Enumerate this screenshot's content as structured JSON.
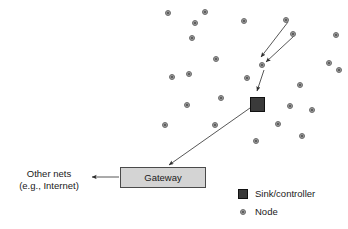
{
  "diagram": {
    "background_color": "#ffffff",
    "line_color": "#444444",
    "node_fill": "#9a9a9a",
    "node_stroke": "#6e6e6e",
    "sink_fill": "#3a3a3a",
    "gateway_fill": "#d4d4d4",
    "gateway_stroke": "#4a4a4a",
    "text_color": "#1a1a1a"
  },
  "labels": {
    "other_nets_line1": "Other nets",
    "other_nets_line2": "(e.g., Internet)",
    "gateway": "Gateway"
  },
  "legend": {
    "items": [
      {
        "label": "Sink/controller",
        "marker": "filled-square",
        "color": "#3a3a3a"
      },
      {
        "label": "Node",
        "marker": "small-circle",
        "color": "#9a9a9a"
      }
    ]
  },
  "nodes": [
    {
      "id": "n1",
      "x": 168,
      "y": 13
    },
    {
      "id": "n2",
      "x": 205,
      "y": 12
    },
    {
      "id": "n3",
      "x": 195,
      "y": 23
    },
    {
      "id": "n4",
      "x": 244,
      "y": 21
    },
    {
      "id": "n5",
      "x": 286,
      "y": 20
    },
    {
      "id": "n6",
      "x": 192,
      "y": 38
    },
    {
      "id": "n7",
      "x": 293,
      "y": 34
    },
    {
      "id": "n8",
      "x": 336,
      "y": 35
    },
    {
      "id": "n9",
      "x": 216,
      "y": 59
    },
    {
      "id": "n10",
      "x": 262,
      "y": 65
    },
    {
      "id": "n11",
      "x": 329,
      "y": 63
    },
    {
      "id": "n12",
      "x": 189,
      "y": 74
    },
    {
      "id": "n13",
      "x": 247,
      "y": 78
    },
    {
      "id": "n14",
      "x": 300,
      "y": 85
    },
    {
      "id": "n15",
      "x": 339,
      "y": 70
    },
    {
      "id": "n16",
      "x": 172,
      "y": 77
    },
    {
      "id": "n17",
      "x": 221,
      "y": 98
    },
    {
      "id": "n18",
      "x": 187,
      "y": 105
    },
    {
      "id": "n19",
      "x": 290,
      "y": 106
    },
    {
      "id": "n20",
      "x": 312,
      "y": 110
    },
    {
      "id": "n21",
      "x": 165,
      "y": 125
    },
    {
      "id": "n22",
      "x": 215,
      "y": 125
    },
    {
      "id": "n23",
      "x": 278,
      "y": 124
    },
    {
      "id": "n24",
      "x": 256,
      "y": 141
    },
    {
      "id": "n25",
      "x": 302,
      "y": 136
    }
  ],
  "sink": {
    "x": 250,
    "y": 97,
    "size": 15
  },
  "gateway_box": {
    "x": 120,
    "y": 167,
    "width": 86,
    "height": 21
  },
  "arrows": [
    {
      "name": "node-to-relay-1",
      "from": [
        288,
        22
      ],
      "to": [
        261,
        57
      ]
    },
    {
      "name": "node-to-relay-2",
      "from": [
        294,
        36
      ],
      "to": [
        266,
        62
      ]
    },
    {
      "name": "relay-to-sink",
      "from": [
        264,
        70
      ],
      "to": [
        257,
        92
      ]
    },
    {
      "name": "sink-to-gateway",
      "from": [
        250,
        107
      ],
      "to": [
        168,
        166
      ]
    },
    {
      "name": "gateway-to-other-nets",
      "from": [
        119,
        177
      ],
      "to": [
        91,
        177
      ]
    }
  ]
}
